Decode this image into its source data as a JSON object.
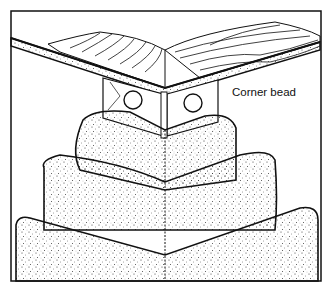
{
  "diagram": {
    "type": "technical illustration",
    "labels": [
      {
        "text": "Corner bead",
        "target": "metal corner bead at top of outside corner"
      }
    ],
    "colors": {
      "line": "#111111",
      "background": "#ffffff"
    }
  }
}
